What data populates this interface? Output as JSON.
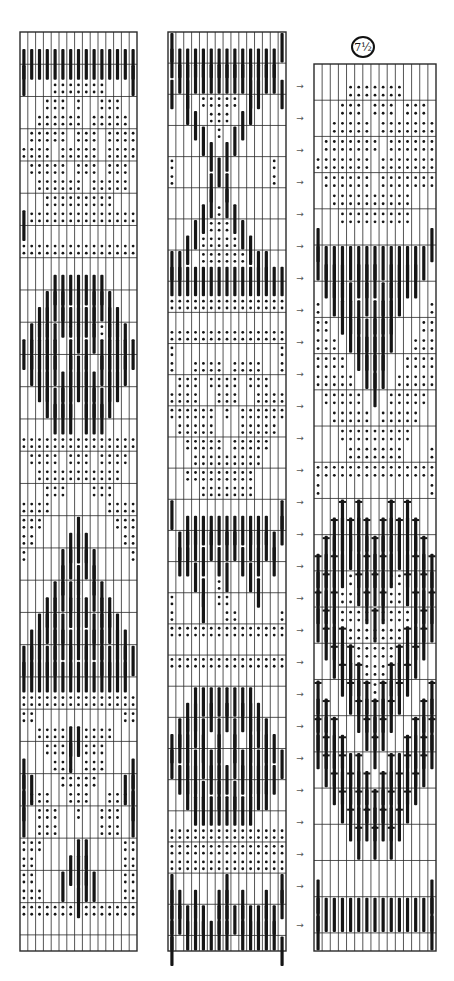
{
  "diagram": {
    "type": "tablet-weaving-pattern-draft",
    "label": "7½",
    "arrow_glyph": "→",
    "colors": {
      "ink": "#151515",
      "grid": "#2a2a2a",
      "background": "#ffffff"
    },
    "legend_symbols": {
      ".": "empty",
      "o": "dots",
      "|": "bar",
      "+": "bar-with-cross"
    },
    "grids": [
      {
        "id": "column-1",
        "x": 20,
        "y": 32,
        "width": 117,
        "height": 919,
        "cols": 15,
        "rows": [
          "...............",
          "|||||||||||||||",
          "|.............|",
          "....ooooooo....",
          "...ooo.o..ooo..",
          "..oooooo.ooooo.",
          ".ooooo.ooo.oooo",
          "oooo.ooooo.oooo",
          ".ooooo.ooo.ooo.",
          "..oooooo.ooooo.",
          "...ooooooooo...",
          "|oooooooooooooo",
          "...............",
          "ooooooooooooooo",
          "...............",
          "....|||||||....",
          "...|||.|.|||...",
          "..||.|||||.||..",
          ".||||.o|.|o|||.",
          "|||||.|.|.|||||",
          ".||||.|||.||||.",
          "..||.|||||.||..",
          "...||||.||||...",
          "....|||.|||....",
          "...............",
          "ooooooooooooooo",
          ".oooo.ooo.oooo.",
          "..ooooooooooo..",
          "...ooo...ooo...",
          "oooo.......oooo",
          "ooo....|....ooo",
          "oo....|||....oo",
          "o....||.||....o",
          ".....|.|.|.....",
          "....||||.||....",
          "...||.|||.||...",
          "..||||.|.||||..",
          ".||.|||||||.||.",
          "|||||.|.|.|||||",
          "||||||||||||||.",
          "...............",
          "ooooooooooooooo",
          "oo...........oo",
          "..oooo||oooo...",
          "...ooo|oooo....",
          "|...ooo.ooo...|",
          "||...ooooo...||",
          "|ooo..ooo..ooo|",
          "|.ooo..o..ooo.|",
          "..ooo.....ooo..",
          "ooo....||....oo",
          "oo....|||....oo",
          "oo...|.|||...oo",
          "ooo....|.....oo",
          "ooooooooooooooo",
          "...............",
          "..............."
        ]
      },
      {
        "id": "column-2",
        "x": 168,
        "y": 32,
        "width": 118,
        "height": 919,
        "cols": 15,
        "rows": [
          "|.............|",
          "||||||||||||||.",
          ".|||||||||||||.",
          "|.|.......||..|",
          "..|.ooooo.|....",
          "...|.ooo.|.....",
          "....|.o.|......",
          ".....|.|.......",
          "o.....|......o.",
          "o....|.|.....o.",
          ".....|.|.......",
          "....|.o.|......",
          "...|.ooo.|.....",
          "..|.ooooo.|....",
          "||..ooooooo||..",
          "|||||||||||||||",
          "...............",
          "ooooooooooooooo",
          "...............",
          "ooooooooooooooo",
          "o.............o",
          "o..oooo.oooo..o",
          ".ooo.oooo.ooo..",
          "oooo..ooo..oooo",
          "oooooo.o.oooooo",
          ".ooooo...ooooo.",
          "..ooooo.ooooo..",
          "...ooooooooo...",
          "..ooooooooo....",
          "....ooooooo....",
          "|.............|",
          "..|||||||||||.|",
          ".|||.|.||.||||.",
          ".||.|.|..|.|.|.",
          "...|...|..|....",
          "....|.o....|...",
          "o...|.oo.......o",
          "o......oo.....o",
          "ooooooooooooooo",
          "...............",
          "ooooooooooooooo",
          "...............",
          "...||||||||....",
          "..||.|.|.|||...",
          ".||||.|.|.|||..",
          "|||.|.|.|.|.||.",
          "|.|||||.|||||.|",
          ".|||.|||.|||||.",
          "..|||.|.|.|||..",
          "...||||||||....",
          "...............",
          "ooooooooooooooo",
          "ooooooooooooooo",
          "ooooooooooooooo",
          "|......|......|",
          "||.|..||.|..|.|",
          "|||||.||||||||.",
          "|.||||||.|||||.",
          "|.............|"
        ]
      },
      {
        "id": "column-3",
        "x": 314,
        "y": 64,
        "width": 122,
        "height": 887,
        "cols": 15,
        "rows": [
          "...............",
          "....ooooooo....",
          "...ooo.ooo.ooo.",
          "..ooooo.ooooooo",
          ".ooooooo.oooooo",
          "ooooooo.ooooooo",
          ".oooooo.ooooooo",
          "..oooooooooo...",
          "...ooooooooo...",
          "|.............|",
          "||||||||||||||.",
          ".|||.|||.||||..",
          "..|||.|.|||....",
          "o..|||.|||....o",
          "oo..||||||...oo",
          "ooo..||||...ooo",
          "oooo..|||..oooo",
          "ooooo..|..ooooo",
          ".ooooo...ooooo.",
          "..ooooo.ooooo..",
          "...ooooooooo...",
          "....ooooooo...o",
          "ooooooooooooooo",
          "o.............o",
          "...+.+...+.+...",
          "..+|+|+.+|+|+..",
          ".+|||||+|||||+.",
          "+|+|.|+|+|.|+|+",
          "|+|oo+|+|oo+|+|",
          "+|+ooo+.+ooo+|+",
          "|+|oooo+oooo|+|",
          ".+|+ooooooo+|+.",
          "..+|+ooooo+|+..",
          "...+|+ooo+|+...",
          "+...+|+o+|+...+",
          "|+...+|+|+...+|",
          "+|+...+|+...+|+",
          "|+|+...+...+|+|",
          ".+|+|+...+|+|+.",
          "..+|+|+.+|+|+..",
          "...+|+|+|+|+...",
          "....+|+|+|+....",
          ".....+.+.+.....",
          "...............",
          "...............",
          "|.............|",
          "|||||||||||||||",
          "|.............|",
          "..............."
        ]
      }
    ],
    "arrows": {
      "x": 300,
      "y_positions": [
        86,
        118,
        150,
        182,
        214,
        246,
        278,
        310,
        342,
        374,
        406,
        438,
        470,
        502,
        534,
        566,
        598,
        630,
        662,
        694,
        726,
        758,
        790,
        822,
        854,
        886,
        925
      ]
    }
  }
}
